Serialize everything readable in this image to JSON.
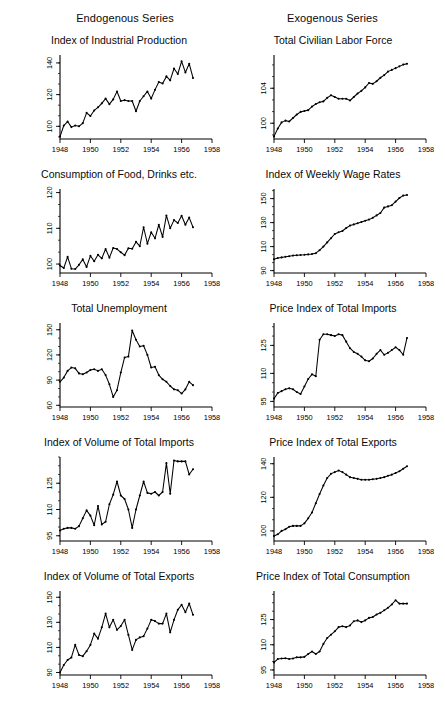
{
  "figure": {
    "column_headings": [
      {
        "id": "endogenous",
        "label": "Endogenous Series"
      },
      {
        "id": "exogenous",
        "label": "Exogenous Series"
      }
    ]
  },
  "chart_data": [
    {
      "id": "index-of-industrial-production",
      "type": "line",
      "column": "Endogenous Series",
      "title": "Index of Industrial Production",
      "xlabel": "",
      "ylabel": "",
      "grid": false,
      "legend": "none",
      "xlim": [
        1948,
        1958
      ],
      "ylim": [
        92,
        145
      ],
      "xticks": [
        1948,
        1950,
        1952,
        1954,
        1956,
        1958
      ],
      "xticklabels": [
        "1948",
        "1950",
        "1952",
        "1954",
        "1956",
        "1958"
      ],
      "yticks": [
        100,
        120,
        140
      ],
      "yticklabels": [
        "100",
        "120",
        "140"
      ],
      "x": [
        1948.0,
        1948.25,
        1948.5,
        1948.75,
        1949.0,
        1949.25,
        1949.5,
        1949.75,
        1950.0,
        1950.25,
        1950.5,
        1950.75,
        1951.0,
        1951.25,
        1951.5,
        1951.75,
        1952.0,
        1952.25,
        1952.5,
        1952.75,
        1953.0,
        1953.25,
        1953.5,
        1953.75,
        1954.0,
        1954.25,
        1954.5,
        1954.75,
        1955.0,
        1955.25,
        1955.5,
        1955.75,
        1956.0,
        1956.25,
        1956.5,
        1956.75
      ],
      "values": [
        93.5,
        100.5,
        103.0,
        99.5,
        100.5,
        100.0,
        102.0,
        108.5,
        106.5,
        110.0,
        112.0,
        114.5,
        117.5,
        114.0,
        117.0,
        122.0,
        116.0,
        116.5,
        116.0,
        116.0,
        109.5,
        116.0,
        119.0,
        122.0,
        117.5,
        123.0,
        128.0,
        127.0,
        131.5,
        129.0,
        136.5,
        133.0,
        141.0,
        134.0,
        139.5,
        130.5,
        137.5
      ]
    },
    {
      "id": "total-civilian-labor-force",
      "type": "line",
      "column": "Exogenous Series",
      "title": "Total Civilian Labor Force",
      "xlabel": "",
      "ylabel": "",
      "grid": false,
      "legend": "none",
      "xlim": [
        1948,
        1958
      ],
      "ylim": [
        98.2,
        107.8
      ],
      "xticks": [
        1948,
        1950,
        1952,
        1954,
        1956,
        1958
      ],
      "xticklabels": [
        "1948",
        "1950",
        "1952",
        "1954",
        "1956",
        "1958"
      ],
      "yticks": [
        100,
        104
      ],
      "yticklabels": [
        "100",
        "104"
      ],
      "x": [
        1948.0,
        1948.25,
        1948.5,
        1948.75,
        1949.0,
        1949.25,
        1949.5,
        1949.75,
        1950.0,
        1950.25,
        1950.5,
        1950.75,
        1951.0,
        1951.25,
        1951.5,
        1951.75,
        1952.0,
        1952.25,
        1952.5,
        1952.75,
        1953.0,
        1953.25,
        1953.5,
        1953.75,
        1954.0,
        1954.25,
        1954.5,
        1954.75,
        1955.0,
        1955.25,
        1955.5,
        1955.75,
        1956.0,
        1956.25,
        1956.5,
        1956.75
      ],
      "values": [
        98.5,
        99.4,
        100.1,
        100.3,
        100.2,
        100.6,
        101.0,
        101.3,
        101.4,
        101.5,
        101.9,
        102.2,
        102.4,
        102.5,
        102.9,
        103.2,
        103.0,
        102.8,
        102.8,
        102.8,
        102.6,
        103.0,
        103.4,
        103.7,
        104.1,
        104.6,
        104.5,
        104.8,
        105.2,
        105.5,
        105.9,
        106.1,
        106.3,
        106.5,
        106.7,
        106.8
      ]
    },
    {
      "id": "consumption-of-food-drinks-etc",
      "type": "line",
      "column": "Endogenous Series",
      "title": "Consumption of Food, Drinks etc.",
      "xlabel": "",
      "ylabel": "",
      "grid": false,
      "legend": "none",
      "xlim": [
        1948,
        1958
      ],
      "ylim": [
        97.5,
        121
      ],
      "xticks": [
        1948,
        1950,
        1952,
        1954,
        1956,
        1958
      ],
      "xticklabels": [
        "1948",
        "1950",
        "1952",
        "1954",
        "1956",
        "1958"
      ],
      "yticks": [
        100,
        110,
        120
      ],
      "yticklabels": [
        "100",
        "110",
        "120"
      ],
      "x": [
        1948.0,
        1948.25,
        1948.5,
        1948.75,
        1949.0,
        1949.25,
        1949.5,
        1949.75,
        1950.0,
        1950.25,
        1950.5,
        1950.75,
        1951.0,
        1951.25,
        1951.5,
        1951.75,
        1952.0,
        1952.25,
        1952.5,
        1952.75,
        1953.0,
        1953.25,
        1953.5,
        1953.75,
        1954.0,
        1954.25,
        1954.5,
        1954.75,
        1955.0,
        1955.25,
        1955.5,
        1955.75,
        1956.0,
        1956.25,
        1956.5,
        1956.75
      ],
      "values": [
        99.6,
        98.9,
        102.0,
        98.7,
        98.6,
        99.8,
        101.3,
        99.2,
        102.3,
        100.8,
        102.6,
        101.6,
        104.2,
        101.8,
        104.5,
        104.2,
        103.3,
        102.5,
        104.4,
        104.3,
        106.2,
        105.0,
        110.3,
        105.7,
        108.9,
        107.2,
        111.0,
        107.6,
        113.6,
        110.0,
        112.3,
        111.5,
        113.5,
        111.0,
        113.0,
        110.3,
        118.5
      ]
    },
    {
      "id": "index-of-weekly-wage-rates",
      "type": "line",
      "column": "Exogenous Series",
      "title": "Index of Weekly Wage Rates",
      "xlabel": "",
      "ylabel": "",
      "grid": false,
      "legend": "none",
      "xlim": [
        1948,
        1958
      ],
      "ylim": [
        88,
        158
      ],
      "xticks": [
        1948,
        1950,
        1952,
        1954,
        1956,
        1958
      ],
      "xticklabels": [
        "1948",
        "1950",
        "1952",
        "1954",
        "1956",
        "1958"
      ],
      "yticks": [
        90,
        110,
        130,
        150
      ],
      "yticklabels": [
        "90",
        "110",
        "130",
        "150"
      ],
      "x": [
        1948.0,
        1948.25,
        1948.5,
        1948.75,
        1949.0,
        1949.25,
        1949.5,
        1949.75,
        1950.0,
        1950.25,
        1950.5,
        1950.75,
        1951.0,
        1951.25,
        1951.5,
        1951.75,
        1952.0,
        1952.25,
        1952.5,
        1952.75,
        1953.0,
        1953.25,
        1953.5,
        1953.75,
        1954.0,
        1954.25,
        1954.5,
        1954.75,
        1955.0,
        1955.25,
        1955.5,
        1955.75,
        1956.0,
        1956.25,
        1956.5,
        1956.75
      ],
      "values": [
        99.5,
        100.5,
        101.0,
        101.5,
        102.0,
        102.5,
        102.8,
        103.0,
        103.2,
        103.5,
        103.8,
        104.5,
        107.0,
        110.0,
        113.5,
        117.0,
        120.5,
        122.0,
        123.0,
        125.5,
        127.5,
        128.5,
        129.5,
        130.5,
        131.5,
        132.5,
        134.0,
        136.0,
        138.0,
        142.5,
        143.5,
        144.5,
        147.5,
        150.5,
        152.5,
        153.0
      ]
    },
    {
      "id": "total-unemployment",
      "type": "line",
      "column": "Endogenous Series",
      "title": "Total Unemployment",
      "xlabel": "",
      "ylabel": "",
      "grid": false,
      "legend": "none",
      "xlim": [
        1948,
        1958
      ],
      "ylim": [
        58,
        158
      ],
      "xticks": [
        1948,
        1950,
        1952,
        1954,
        1956,
        1958
      ],
      "xticklabels": [
        "1948",
        "1950",
        "1952",
        "1954",
        "1956",
        "1958"
      ],
      "yticks": [
        60,
        90,
        120,
        150
      ],
      "yticklabels": [
        "60",
        "90",
        "120",
        "150"
      ],
      "x": [
        1948.0,
        1948.25,
        1948.5,
        1948.75,
        1949.0,
        1949.25,
        1949.5,
        1949.75,
        1950.0,
        1950.25,
        1950.5,
        1950.75,
        1951.0,
        1951.25,
        1951.5,
        1951.75,
        1952.0,
        1952.25,
        1952.5,
        1952.75,
        1953.0,
        1953.25,
        1953.5,
        1953.75,
        1954.0,
        1954.25,
        1954.5,
        1954.75,
        1955.0,
        1955.25,
        1955.5,
        1955.75,
        1956.0,
        1956.25,
        1956.5,
        1956.75
      ],
      "values": [
        88.0,
        93.0,
        101.0,
        105.0,
        104.0,
        98.0,
        97.0,
        99.0,
        102.0,
        103.0,
        101.0,
        103.0,
        96.0,
        85.0,
        70.0,
        78.0,
        99.0,
        117.0,
        118.0,
        149.0,
        138.0,
        130.0,
        131.0,
        120.0,
        105.0,
        106.0,
        96.0,
        91.0,
        88.0,
        83.0,
        79.0,
        78.0,
        74.0,
        79.0,
        88.0,
        84.0
      ]
    },
    {
      "id": "price-index-of-total-imports",
      "type": "line",
      "column": "Exogenous Series",
      "title": "Price Index of Total Imports",
      "xlabel": "",
      "ylabel": "",
      "grid": false,
      "legend": "none",
      "xlim": [
        1948,
        1958
      ],
      "ylim": [
        92,
        137
      ],
      "xticks": [
        1948,
        1950,
        1952,
        1954,
        1956,
        1958
      ],
      "xticklabels": [
        "1948",
        "1950",
        "1952",
        "1954",
        "1956",
        "1958"
      ],
      "yticks": [
        95,
        110,
        125
      ],
      "yticklabels": [
        "95",
        "110",
        "125"
      ],
      "x": [
        1948.0,
        1948.25,
        1948.5,
        1948.75,
        1949.0,
        1949.25,
        1949.5,
        1949.75,
        1950.0,
        1950.25,
        1950.5,
        1950.75,
        1951.0,
        1951.25,
        1951.5,
        1951.75,
        1952.0,
        1952.25,
        1952.5,
        1952.75,
        1953.0,
        1953.25,
        1953.5,
        1953.75,
        1954.0,
        1954.25,
        1954.5,
        1954.75,
        1955.0,
        1955.25,
        1955.5,
        1955.75,
        1956.0,
        1956.25,
        1956.5,
        1956.75
      ],
      "values": [
        96.5,
        99.5,
        100.5,
        101.5,
        102.0,
        101.5,
        100.0,
        99.0,
        103.0,
        107.0,
        109.5,
        108.5,
        128.0,
        131.0,
        131.0,
        130.5,
        130.0,
        131.0,
        130.5,
        127.0,
        123.5,
        121.5,
        120.5,
        119.0,
        117.0,
        116.5,
        118.0,
        120.5,
        122.5,
        120.0,
        121.0,
        122.5,
        124.0,
        122.5,
        120.0,
        129.0
      ]
    },
    {
      "id": "index-of-volume-of-total-imports",
      "type": "line",
      "column": "Endogenous Series",
      "title": "Index of Volume of Total Imports",
      "xlabel": "",
      "ylabel": "",
      "grid": false,
      "legend": "none",
      "xlim": [
        1948,
        1958
      ],
      "ylim": [
        92,
        140
      ],
      "xticks": [
        1948,
        1950,
        1952,
        1954,
        1956,
        1958
      ],
      "xticklabels": [
        "1948",
        "1950",
        "1952",
        "1954",
        "1956",
        "1958"
      ],
      "yticks": [
        95,
        110,
        125
      ],
      "yticklabels": [
        "95",
        "110",
        "125"
      ],
      "x": [
        1948.0,
        1948.25,
        1948.5,
        1948.75,
        1949.0,
        1949.25,
        1949.5,
        1949.75,
        1950.0,
        1950.25,
        1950.5,
        1950.75,
        1951.0,
        1951.25,
        1951.5,
        1951.75,
        1952.0,
        1952.25,
        1952.5,
        1952.75,
        1953.0,
        1953.25,
        1953.5,
        1953.75,
        1954.0,
        1954.25,
        1954.5,
        1954.75,
        1955.0,
        1955.25,
        1955.5,
        1955.75,
        1956.0,
        1956.25,
        1956.5,
        1956.75
      ],
      "values": [
        98.0,
        99.0,
        99.5,
        99.5,
        99.0,
        100.5,
        105.0,
        109.5,
        106.5,
        101.0,
        112.0,
        101.5,
        103.0,
        113.0,
        118.5,
        126.0,
        118.0,
        116.0,
        110.0,
        99.5,
        110.0,
        118.0,
        126.0,
        119.5,
        119.0,
        120.0,
        118.0,
        120.0,
        136.5,
        119.0,
        138.0,
        137.5,
        137.5,
        137.5,
        130.0,
        133.0
      ]
    },
    {
      "id": "price-index-of-total-exports",
      "type": "line",
      "column": "Exogenous Series",
      "title": "Price Index of Total Exports",
      "xlabel": "",
      "ylabel": "",
      "grid": false,
      "legend": "none",
      "xlim": [
        1948,
        1958
      ],
      "ylim": [
        94,
        144
      ],
      "xticks": [
        1948,
        1950,
        1952,
        1954,
        1956,
        1958
      ],
      "xticklabels": [
        "1948",
        "1950",
        "1952",
        "1954",
        "1956",
        "1958"
      ],
      "yticks": [
        100,
        120,
        140
      ],
      "yticklabels": [
        "100",
        "120",
        "140"
      ],
      "x": [
        1948.0,
        1948.25,
        1948.5,
        1948.75,
        1949.0,
        1949.25,
        1949.5,
        1949.75,
        1950.0,
        1950.25,
        1950.5,
        1950.75,
        1951.0,
        1951.25,
        1951.5,
        1951.75,
        1952.0,
        1952.25,
        1952.5,
        1952.75,
        1953.0,
        1953.25,
        1953.5,
        1953.75,
        1954.0,
        1954.25,
        1954.5,
        1954.75,
        1955.0,
        1955.25,
        1955.5,
        1955.75,
        1956.0,
        1956.25,
        1956.5,
        1956.75
      ],
      "values": [
        97.0,
        98.0,
        100.0,
        101.0,
        102.5,
        103.0,
        103.0,
        103.0,
        104.5,
        107.5,
        111.0,
        116.5,
        122.0,
        127.0,
        131.5,
        134.0,
        135.0,
        136.0,
        135.0,
        133.5,
        132.0,
        131.5,
        131.0,
        130.5,
        130.5,
        130.5,
        130.8,
        131.0,
        131.5,
        132.0,
        132.8,
        133.5,
        134.5,
        135.5,
        137.0,
        138.5
      ]
    },
    {
      "id": "index-of-volume-of-total-exports",
      "type": "line",
      "column": "Endogenous Series",
      "title": "Index of Volume of Total Exports",
      "xlabel": "",
      "ylabel": "",
      "grid": false,
      "legend": "none",
      "xlim": [
        1948,
        1958
      ],
      "ylim": [
        88,
        155
      ],
      "xticks": [
        1948,
        1950,
        1952,
        1954,
        1956,
        1958
      ],
      "xticklabels": [
        "1948",
        "1950",
        "1952",
        "1954",
        "1956",
        "1958"
      ],
      "yticks": [
        90,
        110,
        130,
        150
      ],
      "yticklabels": [
        "90",
        "110",
        "130",
        "150"
      ],
      "x": [
        1948.0,
        1948.25,
        1948.5,
        1948.75,
        1949.0,
        1949.25,
        1949.5,
        1949.75,
        1950.0,
        1950.25,
        1950.5,
        1950.75,
        1951.0,
        1951.25,
        1951.5,
        1951.75,
        1952.0,
        1952.25,
        1952.5,
        1952.75,
        1953.0,
        1953.25,
        1953.5,
        1953.75,
        1954.0,
        1954.25,
        1954.5,
        1954.75,
        1955.0,
        1955.25,
        1955.5,
        1955.75,
        1956.0,
        1956.25,
        1956.5,
        1956.75
      ],
      "values": [
        90.0,
        96.0,
        100.0,
        102.0,
        112.0,
        104.0,
        103.0,
        107.0,
        112.0,
        121.0,
        117.0,
        126.0,
        137.0,
        126.0,
        132.0,
        124.0,
        127.0,
        132.0,
        120.0,
        108.0,
        116.0,
        118.0,
        119.0,
        125.0,
        132.0,
        131.0,
        129.0,
        129.0,
        137.0,
        122.0,
        132.0,
        140.0,
        144.0,
        138.0,
        145.0,
        136.0,
        151.0
      ]
    },
    {
      "id": "price-index-of-total-consumption",
      "type": "line",
      "column": "Exogenous Series",
      "title": "Price Index of Total Consumption",
      "xlabel": "",
      "ylabel": "",
      "grid": false,
      "legend": "none",
      "xlim": [
        1948,
        1958
      ],
      "ylim": [
        92,
        142
      ],
      "xticks": [
        1948,
        1950,
        1952,
        1954,
        1956,
        1958
      ],
      "xticklabels": [
        "1948",
        "1950",
        "1952",
        "1954",
        "1956",
        "1958"
      ],
      "yticks": [
        95,
        110,
        125
      ],
      "yticklabels": [
        "95",
        "110",
        "125"
      ],
      "x": [
        1948.0,
        1948.25,
        1948.5,
        1948.75,
        1949.0,
        1949.25,
        1949.5,
        1949.75,
        1950.0,
        1950.25,
        1950.5,
        1950.75,
        1951.0,
        1951.25,
        1951.5,
        1951.75,
        1952.0,
        1952.25,
        1952.5,
        1952.75,
        1953.0,
        1953.25,
        1953.5,
        1953.75,
        1954.0,
        1954.25,
        1954.5,
        1954.75,
        1955.0,
        1955.25,
        1955.5,
        1955.75,
        1956.0,
        1956.25,
        1956.5,
        1956.75
      ],
      "values": [
        99.5,
        101.5,
        101.8,
        102.0,
        101.5,
        101.8,
        102.5,
        102.5,
        102.8,
        104.5,
        106.0,
        104.5,
        106.0,
        110.5,
        114.0,
        116.0,
        118.0,
        120.5,
        121.0,
        120.5,
        121.5,
        124.0,
        124.5,
        123.5,
        124.5,
        126.0,
        126.5,
        128.0,
        129.0,
        130.5,
        132.0,
        134.0,
        136.5,
        134.5,
        134.5,
        134.5
      ]
    }
  ]
}
